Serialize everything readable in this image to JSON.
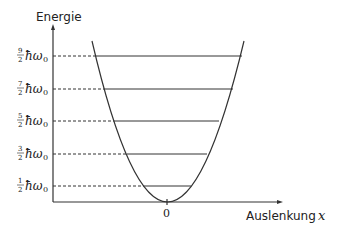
{
  "diagram": {
    "y_axis_label": "Energie",
    "x_axis_label": "Auslenkung",
    "x_axis_var": "x",
    "origin_tick": "0",
    "energy_levels": [
      {
        "num": "9",
        "den": "2",
        "unit": "ħω",
        "sub": "0"
      },
      {
        "num": "7",
        "den": "2",
        "unit": "ħω",
        "sub": "0"
      },
      {
        "num": "5",
        "den": "2",
        "unit": "ħω",
        "sub": "0"
      },
      {
        "num": "3",
        "den": "2",
        "unit": "ħω",
        "sub": "0"
      },
      {
        "num": "1",
        "den": "2",
        "unit": "ħω",
        "sub": "0"
      }
    ],
    "colors": {
      "stroke": "#333333",
      "text": "#222222"
    }
  }
}
